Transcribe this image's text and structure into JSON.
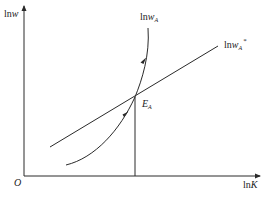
{
  "diagram": {
    "y_axis_label": {
      "text": "ln",
      "var": "w"
    },
    "x_axis_label": {
      "text": "ln",
      "var": "K"
    },
    "origin_label": "O",
    "curve_label": {
      "text": "ln",
      "var": "w",
      "sub": "A"
    },
    "line_label": {
      "text": "ln",
      "var": "w",
      "sub": "A",
      "sup": "*"
    },
    "point_label": {
      "var": "E",
      "sub": "A"
    },
    "colors": {
      "stroke": "#2a2a2a",
      "background": "#ffffff"
    }
  }
}
